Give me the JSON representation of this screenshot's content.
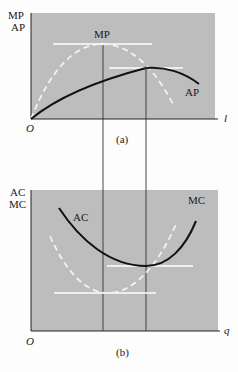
{
  "panel_a": {
    "y_label_line1": "MP",
    "y_label_line2": "AP",
    "x_label": "l",
    "origin": "O",
    "caption": "(a)",
    "curve_labels": {
      "mp": "MP",
      "ap": "AP"
    }
  },
  "panel_b": {
    "y_label_line1": "AC",
    "y_label_line2": "MC",
    "x_label": "q",
    "origin": "O",
    "caption": "(b)",
    "curve_labels": {
      "ac": "AC",
      "mc": "MC"
    }
  },
  "colors": {
    "panel_fill": "#bdbdbd",
    "axis": "#222222",
    "solid_curve": "#111111",
    "dashed_curve": "#f2f2f2",
    "guide_line": "#ffffff",
    "drop_line": "#333333"
  }
}
